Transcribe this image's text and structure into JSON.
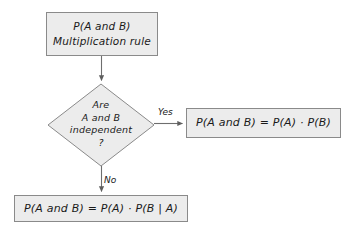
{
  "diagram": {
    "type": "flowchart",
    "palette": {
      "node_fill": "#ececec",
      "node_border": "#8a8a8a",
      "connector": "#6e6e6e",
      "text": "#1a1a1a",
      "background": "#ffffff"
    },
    "nodes": [
      {
        "id": "start",
        "shape": "rectangle",
        "lines": [
          "P(A and B)",
          "Multiplication rule"
        ]
      },
      {
        "id": "decision",
        "shape": "diamond",
        "lines": [
          "Are",
          "A and B",
          "independent",
          "?"
        ]
      },
      {
        "id": "independent",
        "shape": "rectangle",
        "lines": [
          "P(A and B)  =  P(A) · P(B)"
        ]
      },
      {
        "id": "dependent",
        "shape": "rectangle",
        "lines": [
          "P(A and B)  =  P(A) · P(B | A)"
        ]
      }
    ],
    "edges": [
      {
        "id": "start-to-decision",
        "label": "",
        "from": "start",
        "to": "decision",
        "direction": "down"
      },
      {
        "id": "decision-to-independent",
        "label": "Yes",
        "from": "decision",
        "to": "independent",
        "direction": "right"
      },
      {
        "id": "decision-to-dependent",
        "label": "No",
        "from": "decision",
        "to": "dependent",
        "direction": "down"
      }
    ]
  }
}
